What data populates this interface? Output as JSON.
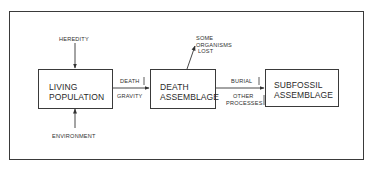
{
  "diagram": {
    "type": "flowchart",
    "nodes": [
      {
        "id": "living",
        "lines": [
          "LIVING",
          "POPULATION"
        ]
      },
      {
        "id": "death",
        "lines": [
          "DEATH",
          "ASSEMBLAGE"
        ]
      },
      {
        "id": "subfossil",
        "lines": [
          "SUBFOSSIL",
          "ASSEMBLAGE"
        ]
      }
    ],
    "inputs": {
      "heredity": "HEREDITY",
      "environment": "ENVIRONMENT"
    },
    "edges": [
      {
        "from": "living",
        "to": "death",
        "label_above": "DEATH",
        "label_below": "GRAVITY"
      },
      {
        "from": "death",
        "to": "subfossil",
        "label_above": "BURIAL",
        "label_below_lines": [
          "OTHER",
          "PROCESSES"
        ]
      }
    ],
    "loss": {
      "lines": [
        "SOME",
        "ORGANISMS",
        "LOST"
      ]
    }
  }
}
